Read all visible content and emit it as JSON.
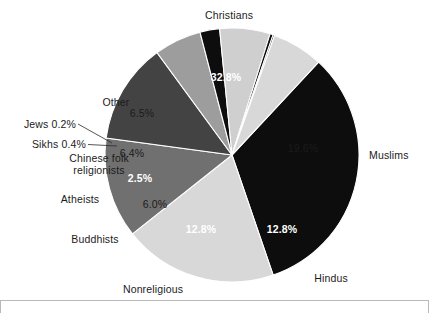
{
  "figure": {
    "title": "",
    "background_color": "#ffffff",
    "frame_color": "#b9b9b9"
  },
  "chart_data": {
    "type": "pie",
    "title": "",
    "xlabel": "",
    "ylabel": "",
    "units": "percent",
    "start_angle_deg": -47,
    "direction": "clockwise",
    "legend": "none",
    "grid": false,
    "labels_position": "outside-with-inside-values",
    "categories": [
      "Christians",
      "Muslims",
      "Hindus",
      "Nonreligious",
      "Buddhists",
      "Atheists",
      "Chinese folk religionists",
      "Sikhs",
      "Jews",
      "Other"
    ],
    "values": [
      32.8,
      19.6,
      12.8,
      12.8,
      6.0,
      2.5,
      6.4,
      0.4,
      0.2,
      6.5
    ],
    "value_labels": [
      "32.8%",
      "19.6%",
      "12.8%",
      "12.8%",
      "6.0%",
      "2.5%",
      "6.4%",
      "0.4%",
      "0.2%",
      "6.5%"
    ],
    "slice_colors": [
      "#0d0d0d",
      "#d8d8d8",
      "#707070",
      "#434343",
      "#9d9d9d",
      "#0d0d0d",
      "#cfcfcf",
      "#0d0d0d",
      "#0d0d0d",
      "#d8d8d8"
    ],
    "slices": [
      {
        "name": "Christians",
        "value": 32.8,
        "label": "32.8%",
        "color": "#0d0d0d",
        "text_color": "#ffffff"
      },
      {
        "name": "Muslims",
        "value": 19.6,
        "label": "19.6%",
        "color": "#d8d8d8",
        "text_color": "#111111"
      },
      {
        "name": "Hindus",
        "value": 12.8,
        "label": "12.8%",
        "color": "#707070",
        "text_color": "#ffffff"
      },
      {
        "name": "Nonreligious",
        "value": 12.8,
        "label": "12.8%",
        "color": "#434343",
        "text_color": "#ffffff"
      },
      {
        "name": "Buddhists",
        "value": 6.0,
        "label": "6.0%",
        "color": "#9d9d9d",
        "text_color": "#111111"
      },
      {
        "name": "Atheists",
        "value": 2.5,
        "label": "2.5%",
        "color": "#0d0d0d",
        "text_color": "#ffffff"
      },
      {
        "name": "Chinese folk religionists",
        "value": 6.4,
        "label": "6.4%",
        "color": "#cfcfcf",
        "text_color": "#111111"
      },
      {
        "name": "Sikhs",
        "value": 0.4,
        "label": "0.4%",
        "color": "#0d0d0d",
        "text_color": "#111111"
      },
      {
        "name": "Jews",
        "value": 0.2,
        "label": "0.2%",
        "color": "#0d0d0d",
        "text_color": "#111111"
      },
      {
        "name": "Other",
        "value": 6.5,
        "label": "6.5%",
        "color": "#d8d8d8",
        "text_color": "#111111"
      }
    ]
  },
  "callouts": {
    "christians": "Christians",
    "muslims": "Muslims",
    "hindus": "Hindus",
    "nonreligious": "Nonreligious",
    "buddhists": "Buddhists",
    "atheists": "Atheists",
    "chinese_folk_line1": "Chinese folk",
    "chinese_folk_line2": "religionists",
    "sikhs": "Sikhs  0.4%",
    "jews": "Jews 0.2%",
    "other": "Other"
  },
  "values": {
    "christians": "32.8%",
    "muslims": "19.6%",
    "hindus": "12.8%",
    "nonreligious": "12.8%",
    "buddhists": "6.0%",
    "atheists": "2.5%",
    "chinese_folk": "6.4%",
    "other": "6.5%"
  }
}
